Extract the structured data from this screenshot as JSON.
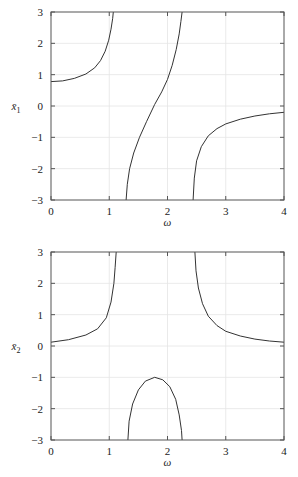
{
  "chart_data": [
    {
      "type": "line",
      "title": "",
      "xlabel": "ω",
      "ylabel": "x̄₁",
      "ylabel_base": "x̄",
      "ylabel_sub": "1",
      "xlim": [
        0,
        4
      ],
      "ylim": [
        -3,
        3
      ],
      "xticks": [
        0,
        1,
        2,
        3,
        4
      ],
      "yticks": [
        -3,
        -2,
        -1,
        0,
        1,
        2,
        3
      ],
      "xtick_labels": [
        "0",
        "1",
        "2",
        "3",
        "4"
      ],
      "ytick_labels": [
        "−3",
        "−2",
        "−1",
        "0",
        "1",
        "2",
        "3"
      ],
      "grid": true,
      "legend": null,
      "series": [
        {
          "name": "branch-1",
          "x": [
            0.0,
            0.2,
            0.4,
            0.6,
            0.75,
            0.85,
            0.93,
            0.99,
            1.03,
            1.06,
            1.07
          ],
          "y": [
            0.78,
            0.8,
            0.88,
            1.02,
            1.22,
            1.45,
            1.75,
            2.1,
            2.45,
            2.8,
            3.0
          ]
        },
        {
          "name": "branch-2",
          "x": [
            1.29,
            1.31,
            1.35,
            1.42,
            1.52,
            1.64,
            1.78,
            1.9,
            2.0,
            2.08,
            2.15,
            2.2,
            2.23,
            2.25
          ],
          "y": [
            -3.0,
            -2.5,
            -2.0,
            -1.5,
            -1.0,
            -0.5,
            0.05,
            0.45,
            0.85,
            1.3,
            1.8,
            2.3,
            2.7,
            3.0
          ]
        },
        {
          "name": "branch-3",
          "x": [
            2.44,
            2.46,
            2.5,
            2.58,
            2.7,
            2.85,
            3.0,
            3.25,
            3.5,
            3.75,
            4.0
          ],
          "y": [
            -3.0,
            -2.3,
            -1.75,
            -1.3,
            -0.95,
            -0.72,
            -0.57,
            -0.42,
            -0.32,
            -0.25,
            -0.2
          ]
        }
      ]
    },
    {
      "type": "line",
      "title": "",
      "xlabel": "ω",
      "ylabel": "x̄₂",
      "ylabel_base": "x̄",
      "ylabel_sub": "2",
      "xlim": [
        0,
        4
      ],
      "ylim": [
        -3,
        3
      ],
      "xticks": [
        0,
        1,
        2,
        3,
        4
      ],
      "yticks": [
        -3,
        -2,
        -1,
        0,
        1,
        2,
        3
      ],
      "xtick_labels": [
        "0",
        "1",
        "2",
        "3",
        "4"
      ],
      "ytick_labels": [
        "−3",
        "−2",
        "−1",
        "0",
        "1",
        "2",
        "3"
      ],
      "grid": true,
      "legend": null,
      "series": [
        {
          "name": "branch-1",
          "x": [
            0.0,
            0.3,
            0.6,
            0.8,
            0.95,
            1.03,
            1.08,
            1.1,
            1.12
          ],
          "y": [
            0.12,
            0.2,
            0.35,
            0.55,
            0.9,
            1.4,
            2.0,
            2.5,
            3.0
          ]
        },
        {
          "name": "branch-2",
          "x": [
            1.32,
            1.34,
            1.4,
            1.5,
            1.62,
            1.78,
            1.92,
            2.04,
            2.14,
            2.2,
            2.24,
            2.25
          ],
          "y": [
            -3.0,
            -2.4,
            -1.85,
            -1.4,
            -1.12,
            -1.0,
            -1.08,
            -1.3,
            -1.7,
            -2.2,
            -2.7,
            -3.0
          ]
        },
        {
          "name": "branch-3",
          "x": [
            2.47,
            2.49,
            2.53,
            2.6,
            2.7,
            2.85,
            3.0,
            3.25,
            3.5,
            3.75,
            4.0
          ],
          "y": [
            3.0,
            2.4,
            1.85,
            1.35,
            0.95,
            0.65,
            0.47,
            0.32,
            0.22,
            0.16,
            0.12
          ]
        }
      ]
    }
  ]
}
